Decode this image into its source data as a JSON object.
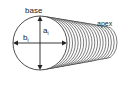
{
  "diagram": {
    "labels": {
      "base": "base",
      "apex": "apex",
      "a": "a",
      "a_sub": "i",
      "b": "b",
      "b_sub": "i"
    },
    "colors": {
      "stroke": "#222222",
      "background": "#ffffff"
    },
    "rings": 18
  }
}
